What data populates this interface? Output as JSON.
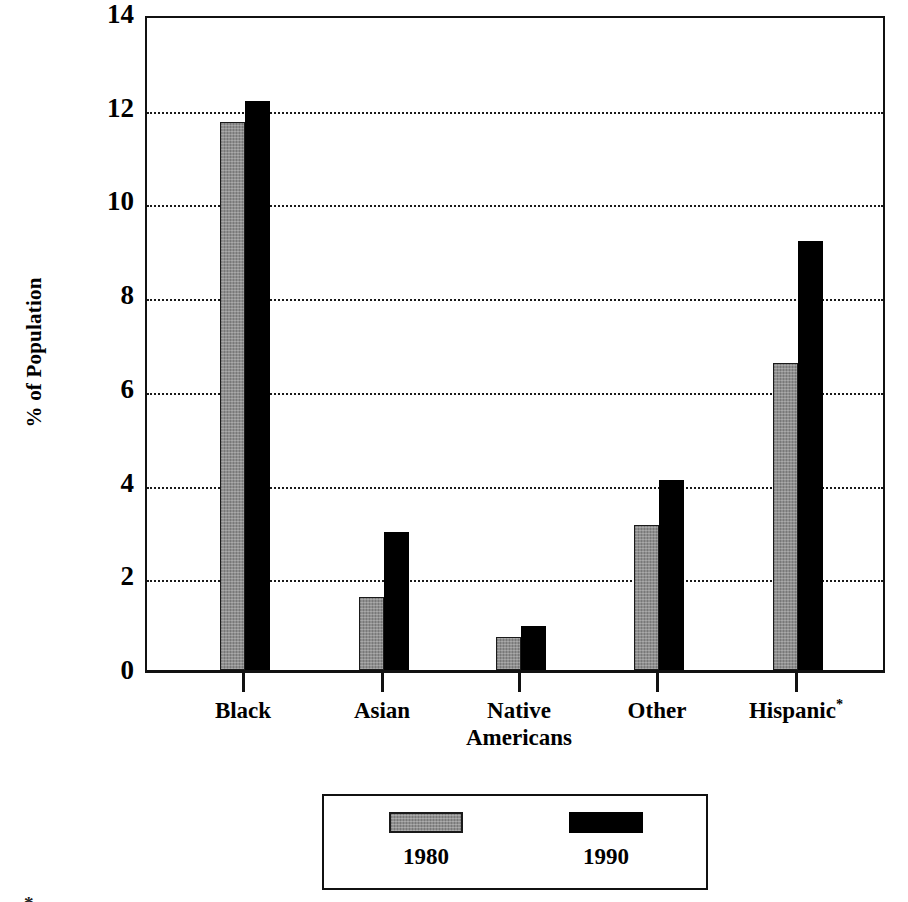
{
  "chart_data": {
    "type": "bar",
    "title": "",
    "xlabel": "",
    "ylabel": "% of Population",
    "ylim": [
      0,
      14
    ],
    "ytick_step": 2,
    "ytick_labels": [
      "0",
      "2",
      "4",
      "6",
      "8",
      "10",
      "12",
      "14"
    ],
    "grid": "horizontal-dotted",
    "legend_position": "below-center",
    "categories": [
      "Black",
      "Asian",
      "Native Americans",
      "Other",
      "Hispanic*"
    ],
    "category_lines": [
      [
        "Black"
      ],
      [
        "Asian"
      ],
      [
        "Native",
        "Americans"
      ],
      [
        "Other"
      ],
      [
        "Hispanic*"
      ]
    ],
    "series": [
      {
        "name": "1980",
        "color": "#8f8f8f",
        "values": [
          11.7,
          1.55,
          0.7,
          3.1,
          6.55
        ]
      },
      {
        "name": "1990",
        "color": "#000000",
        "values": [
          12.15,
          2.95,
          0.95,
          4.05,
          9.15
        ]
      }
    ],
    "footnote": "*"
  },
  "legend": {
    "entries": [
      {
        "label": "1980",
        "swatch": "gray-hatched-swatch"
      },
      {
        "label": "1990",
        "swatch": "black-swatch"
      }
    ]
  },
  "colors": {
    "series_1980": "#8f8f8f",
    "series_1990": "#000000",
    "axis": "#111111",
    "background": "#ffffff"
  }
}
